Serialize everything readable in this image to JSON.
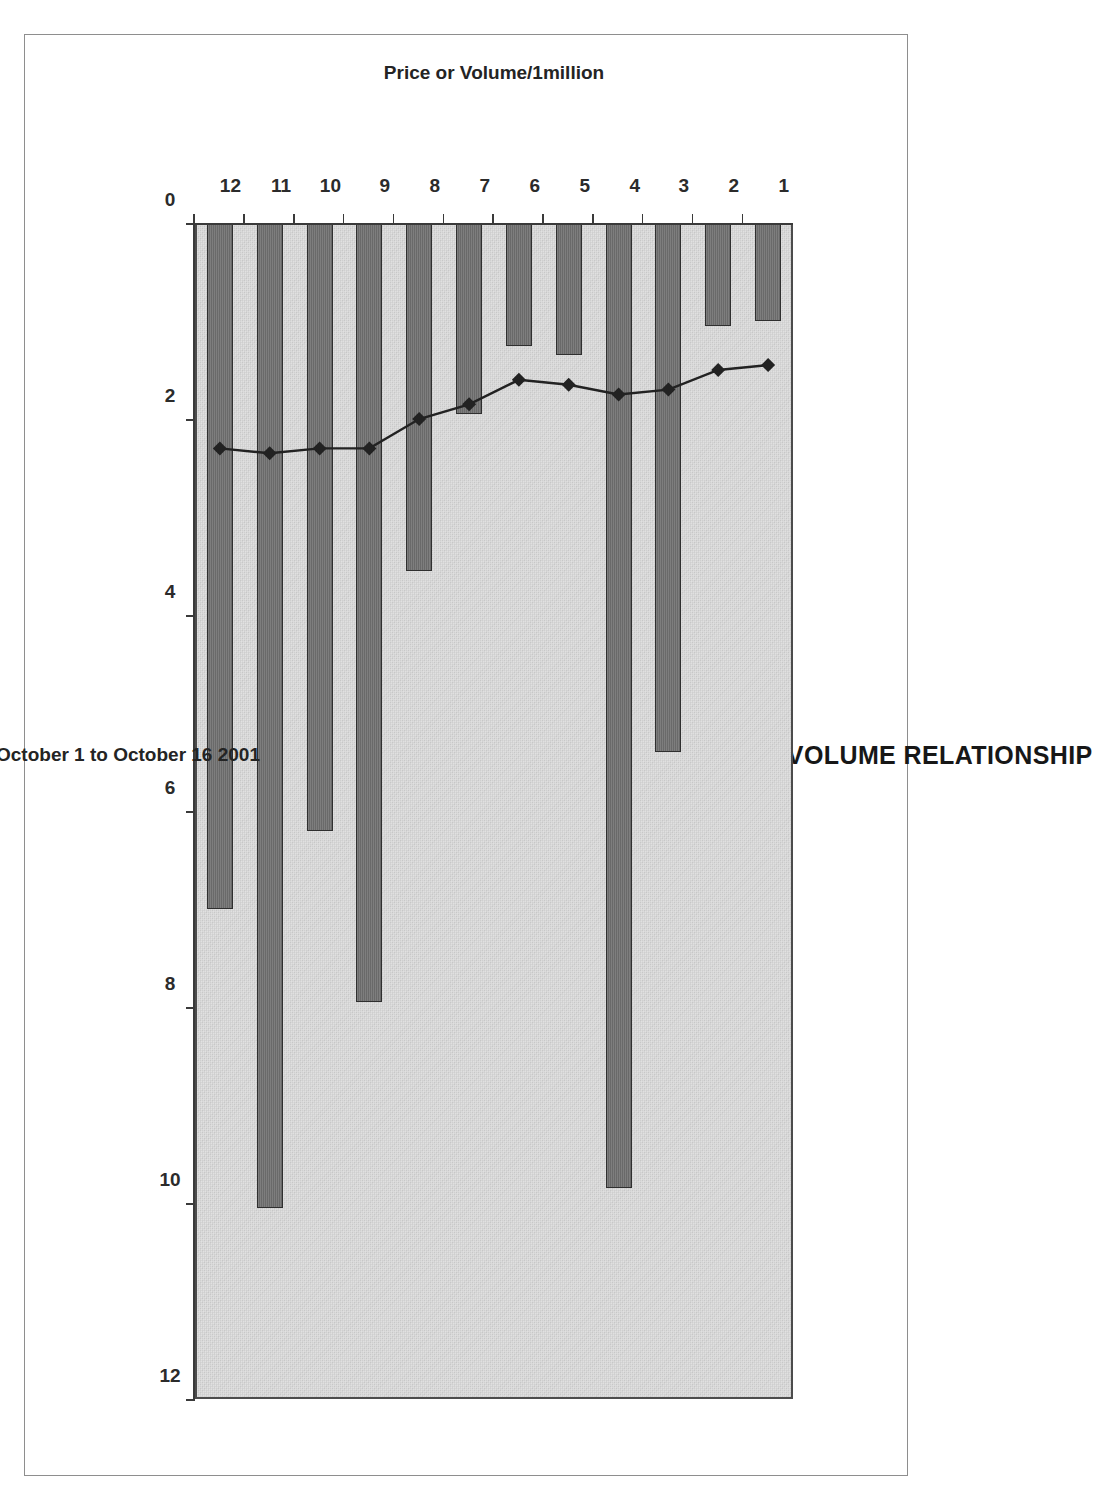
{
  "chart_data": {
    "type": "bar",
    "orientation": "horizontal-rotated",
    "title": "CORV PRICE VOLUME RELATIONSHIP",
    "xlabel": "October 1 to October 16 2001",
    "ylabel": "Price or Volume/1million",
    "categories": [
      "1",
      "2",
      "3",
      "4",
      "5",
      "6",
      "7",
      "8",
      "9",
      "10",
      "11",
      "12"
    ],
    "ylim": [
      0,
      12
    ],
    "yticks": [
      0,
      2,
      4,
      6,
      8,
      10,
      12
    ],
    "ytick_labels": [
      "0",
      "2",
      "4",
      "6",
      "8",
      "10",
      "12"
    ],
    "grid": false,
    "legend": "none",
    "series": [
      {
        "name": "Volume/1million",
        "type": "bar",
        "color": "#6f6f6f",
        "edge_color": "#2f2f2f",
        "values": [
          1.0,
          1.05,
          5.4,
          9.85,
          1.35,
          1.25,
          1.95,
          3.55,
          7.95,
          6.2,
          10.05,
          7.0
        ]
      },
      {
        "name": "Price",
        "type": "line",
        "color": "#222222",
        "marker": "diamond",
        "values": [
          1.45,
          1.5,
          1.7,
          1.75,
          1.65,
          1.6,
          1.85,
          2.0,
          2.3,
          2.3,
          2.35,
          2.3
        ]
      }
    ]
  },
  "chart": {
    "title": "CORV PRICE VOLUME RELATIONSHIP",
    "value_axis_title": "October 1 to October 16 2001",
    "category_axis_title": "Price or Volume/1million",
    "value_ticks": [
      "0",
      "2",
      "4",
      "6",
      "8",
      "10",
      "12"
    ],
    "category_ticks": [
      "1",
      "2",
      "3",
      "4",
      "5",
      "6",
      "7",
      "8",
      "9",
      "10",
      "11",
      "12"
    ]
  },
  "colors": {
    "plot_background": "#cfcfcf",
    "bar_fill": "#6f6f6f",
    "bar_edge": "#2f2f2f",
    "line": "#222222",
    "axis": "#3a3a3a",
    "frame": "#8e8e8e",
    "text": "#1a1a1a"
  }
}
